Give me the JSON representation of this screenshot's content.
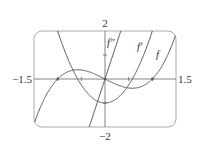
{
  "chart_data": {
    "type": "line",
    "title": "",
    "xlabel": "",
    "ylabel": "",
    "xlim": [
      -1.5,
      1.5
    ],
    "ylim": [
      -2,
      2
    ],
    "x_tick_labels": [
      "-1.5",
      "1.5"
    ],
    "y_tick_labels": [
      "2",
      "-2"
    ],
    "x_ticks": [
      -1,
      -0.5,
      0.5,
      1
    ],
    "y_ticks": [
      -1,
      1
    ],
    "grid": false,
    "legend": "inline curve labels",
    "series": [
      {
        "name": "f",
        "expression": "x^3 - x",
        "label": "f",
        "x": [
          -1.5,
          -1.0,
          -0.577,
          0,
          0.577,
          1.0,
          1.5
        ],
        "y": [
          -1.875,
          0,
          0.385,
          0,
          -0.385,
          0,
          1.875
        ]
      },
      {
        "name": "f'",
        "expression": "3x^2 - 1",
        "label": "f'",
        "x": [
          -1.0,
          -0.577,
          0,
          0.577,
          1.0
        ],
        "y": [
          2,
          0,
          -1,
          0,
          2
        ]
      },
      {
        "name": "f''",
        "expression": "6x",
        "label": "f''",
        "x": [
          -0.333,
          0,
          0.333
        ],
        "y": [
          -2,
          0,
          2
        ]
      }
    ],
    "annotations": [
      "f''",
      "f'",
      "f"
    ]
  },
  "labels": {
    "y_max": "2",
    "y_min": "−2",
    "x_min": "−1.5",
    "x_max": "1.5",
    "curve_f": "f",
    "curve_fp": "f′",
    "curve_fpp": "f″"
  },
  "colors": {
    "curve": "#555555",
    "frame": "#aaaaaa",
    "axis": "#666666",
    "text": "#333333"
  }
}
